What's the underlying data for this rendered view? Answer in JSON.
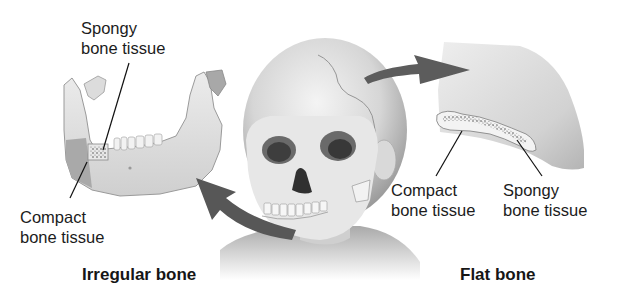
{
  "diagram": {
    "irregular": {
      "title": "Irregular bone",
      "labels": {
        "spongy_line1": "Spongy",
        "spongy_line2": "bone tissue",
        "compact_line1": "Compact",
        "compact_line2": "bone tissue"
      }
    },
    "flat": {
      "title": "Flat bone",
      "labels": {
        "compact_line1": "Compact",
        "compact_line2": "bone tissue",
        "spongy_line1": "Spongy",
        "spongy_line2": "bone tissue"
      }
    },
    "colors": {
      "background": "#ffffff",
      "bone_light": "#e6e6e6",
      "bone_mid": "#c8c8c8",
      "bone_dark": "#8e8e8e",
      "arrow": "#5a5a5a",
      "leader_line": "#111111",
      "text": "#1c1c1c"
    },
    "icons": {
      "arrow_to_flat": "curved-arrow-right",
      "arrow_to_irregular": "curved-arrow-left"
    }
  }
}
